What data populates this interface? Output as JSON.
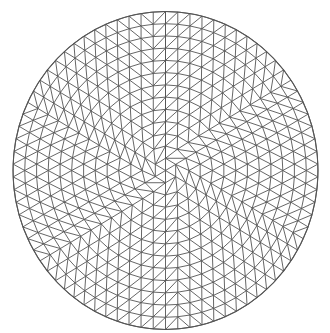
{
  "diagram": {
    "type": "circular-triangular-mesh",
    "canvas": {
      "width": 330,
      "height": 333,
      "background": "#ffffff"
    },
    "disk": {
      "cx": 165.5,
      "cy": 170.5,
      "rx": 152.5,
      "ry": 159
    },
    "rings": 13,
    "nodes_per_ring_factor": 6,
    "stroke_color": "#555555",
    "stroke_width": 0.9,
    "boundary_stroke_width": 1.1
  }
}
